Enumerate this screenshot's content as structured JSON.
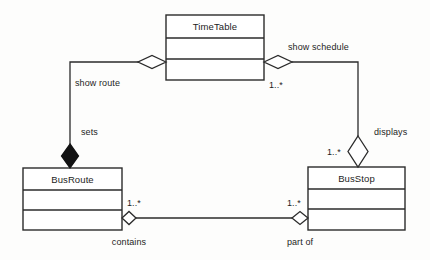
{
  "diagram": {
    "kind": "uml-class-diagram",
    "background_color": "#fdfdfc",
    "line_color": "#2b2b2b",
    "fill_color": "#ffffff",
    "composition_fill_color": "#121212",
    "classes": [
      {
        "id": "timetable",
        "name": "TimeTable",
        "x": 166,
        "y": 15,
        "width": 98,
        "height": 65,
        "compartments": 3
      },
      {
        "id": "busroute",
        "name": "BusRoute",
        "x": 23,
        "y": 168,
        "width": 99,
        "height": 62,
        "compartments": 3
      },
      {
        "id": "busstop",
        "name": "BusStop",
        "x": 308,
        "y": 167,
        "width": 97,
        "height": 63,
        "compartments": 3
      }
    ],
    "relationships": [
      {
        "id": "show-route",
        "label": "show route",
        "from": "timetable",
        "to": "busroute",
        "aggregation": "shared",
        "diamond_orientation": "horizontal",
        "multiplicity": ""
      },
      {
        "id": "sets",
        "label": "sets",
        "from": "timetable",
        "to": "busroute",
        "aggregation": "composite",
        "diamond_orientation": "vertical",
        "multiplicity": ""
      },
      {
        "id": "show-schedule",
        "label": "show schedule",
        "from": "timetable",
        "to": "busstop",
        "aggregation": "shared",
        "diamond_orientation": "horizontal",
        "multiplicity": "1..*"
      },
      {
        "id": "displays",
        "label": "displays",
        "from": "busstop",
        "to": "timetable",
        "aggregation": "shared",
        "diamond_orientation": "vertical",
        "multiplicity": "1..*"
      },
      {
        "id": "contains",
        "label": "contains",
        "from": "busroute",
        "to": "busstop",
        "aggregation": "shared",
        "diamond_orientation": "horizontal",
        "multiplicity": "1..*"
      },
      {
        "id": "part-of",
        "label": "part of",
        "from": "busstop",
        "to": "busroute",
        "aggregation": "shared",
        "diamond_orientation": "horizontal",
        "multiplicity": "1..*"
      }
    ]
  }
}
